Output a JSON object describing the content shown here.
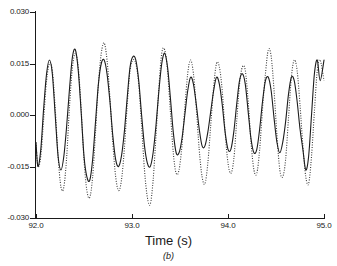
{
  "chart_data": {
    "type": "line",
    "title": "",
    "subtitle": "",
    "caption": "(b)",
    "xlabel": "Time (s)",
    "ylabel": "",
    "xlim": [
      92.0,
      95.0
    ],
    "ylim": [
      -0.03,
      0.03
    ],
    "xticks": [
      "92.0",
      "93.0",
      "94.0",
      "95.0"
    ],
    "xtick_values": [
      92.0,
      93.0,
      94.0,
      95.0
    ],
    "yticks": [
      "0.030",
      "0.015",
      "0.000",
      "-0.015",
      "-0.030"
    ],
    "ytick_values": [
      0.03,
      0.015,
      0.0,
      -0.015,
      -0.03
    ],
    "grid": false,
    "legend": null,
    "legend_position": "none",
    "frame": "left-bottom",
    "colors": {
      "solid_trace": "#1c1c1c",
      "dotted_trace": "#3a3a3a",
      "axis": "#1a1a1a",
      "background": "#ffffff"
    },
    "series": [
      {
        "name": "solid",
        "style": "solid",
        "x": [
          92.0,
          92.02,
          92.05,
          92.08,
          92.11,
          92.14,
          92.17,
          92.2,
          92.23,
          92.26,
          92.29,
          92.32,
          92.35,
          92.38,
          92.41,
          92.44,
          92.47,
          92.5,
          92.53,
          92.56,
          92.59,
          92.62,
          92.65,
          92.68,
          92.71,
          92.74,
          92.77,
          92.8,
          92.83,
          92.86,
          92.89,
          92.92,
          92.95,
          92.98,
          93.01,
          93.04,
          93.07,
          93.1,
          93.13,
          93.16,
          93.19,
          93.22,
          93.25,
          93.28,
          93.31,
          93.34,
          93.37,
          93.4,
          93.43,
          93.46,
          93.49,
          93.52,
          93.55,
          93.58,
          93.61,
          93.64,
          93.67,
          93.7,
          93.73,
          93.76,
          93.79,
          93.82,
          93.85,
          93.88,
          93.91,
          93.94,
          93.97,
          94.0,
          94.03,
          94.06,
          94.09,
          94.12,
          94.15,
          94.18,
          94.21,
          94.24,
          94.27,
          94.3,
          94.33,
          94.36,
          94.39,
          94.42,
          94.45,
          94.48,
          94.51,
          94.54,
          94.57,
          94.6,
          94.63,
          94.66,
          94.69,
          94.72,
          94.75,
          94.78,
          94.81,
          94.84,
          94.87,
          94.9,
          94.93,
          94.96,
          95.0
        ],
        "y": [
          -0.008,
          -0.015,
          -0.01,
          0.002,
          0.012,
          0.016,
          0.012,
          0.0,
          -0.012,
          -0.016,
          -0.012,
          -0.003,
          0.008,
          0.017,
          0.019,
          0.013,
          0.001,
          -0.012,
          -0.018,
          -0.019,
          -0.013,
          -0.002,
          0.009,
          0.015,
          0.016,
          0.012,
          0.004,
          -0.006,
          -0.013,
          -0.015,
          -0.012,
          -0.005,
          0.005,
          0.014,
          0.017,
          0.016,
          0.01,
          0.0,
          -0.009,
          -0.014,
          -0.015,
          -0.011,
          -0.003,
          0.007,
          0.015,
          0.018,
          0.014,
          0.005,
          -0.005,
          -0.011,
          -0.011,
          -0.007,
          0.0,
          0.007,
          0.011,
          0.009,
          0.003,
          -0.004,
          -0.009,
          -0.009,
          -0.005,
          0.001,
          0.007,
          0.011,
          0.009,
          0.003,
          -0.005,
          -0.01,
          -0.01,
          -0.005,
          0.003,
          0.01,
          0.012,
          0.009,
          0.001,
          -0.007,
          -0.011,
          -0.01,
          -0.004,
          0.004,
          0.01,
          0.011,
          0.007,
          -0.001,
          -0.008,
          -0.011,
          -0.008,
          -0.002,
          0.006,
          0.011,
          0.01,
          0.004,
          -0.004,
          -0.01,
          -0.016,
          -0.012,
          0.0,
          0.012,
          0.016,
          0.01,
          0.016
        ]
      },
      {
        "name": "dotted",
        "style": "dotted",
        "x": [
          92.0,
          92.02,
          92.05,
          92.08,
          92.11,
          92.14,
          92.17,
          92.2,
          92.23,
          92.26,
          92.29,
          92.32,
          92.35,
          92.38,
          92.41,
          92.44,
          92.47,
          92.5,
          92.53,
          92.56,
          92.59,
          92.62,
          92.65,
          92.68,
          92.71,
          92.74,
          92.77,
          92.8,
          92.83,
          92.86,
          92.89,
          92.92,
          92.95,
          92.98,
          93.01,
          93.04,
          93.07,
          93.1,
          93.13,
          93.16,
          93.19,
          93.22,
          93.25,
          93.28,
          93.31,
          93.34,
          93.37,
          93.4,
          93.43,
          93.46,
          93.49,
          93.52,
          93.55,
          93.58,
          93.61,
          93.64,
          93.67,
          93.7,
          93.73,
          93.76,
          93.79,
          93.82,
          93.85,
          93.88,
          93.91,
          93.94,
          93.97,
          94.0,
          94.03,
          94.06,
          94.09,
          94.12,
          94.15,
          94.18,
          94.21,
          94.24,
          94.27,
          94.3,
          94.33,
          94.36,
          94.39,
          94.42,
          94.45,
          94.48,
          94.51,
          94.54,
          94.57,
          94.6,
          94.63,
          94.66,
          94.69,
          94.72,
          94.75,
          94.78,
          94.81,
          94.84,
          94.87,
          94.9,
          94.93,
          94.96,
          95.0
        ],
        "y": [
          -0.008,
          -0.015,
          -0.012,
          -0.001,
          0.01,
          0.015,
          0.013,
          0.002,
          -0.012,
          -0.021,
          -0.021,
          -0.012,
          0.003,
          0.014,
          0.018,
          0.014,
          0.002,
          -0.013,
          -0.022,
          -0.024,
          -0.018,
          -0.005,
          0.009,
          0.018,
          0.021,
          0.016,
          0.005,
          -0.008,
          -0.018,
          -0.022,
          -0.019,
          -0.01,
          0.003,
          0.013,
          0.016,
          0.015,
          0.009,
          -0.003,
          -0.016,
          -0.024,
          -0.026,
          -0.019,
          -0.006,
          0.008,
          0.018,
          0.019,
          0.013,
          0.001,
          -0.011,
          -0.017,
          -0.016,
          -0.009,
          0.002,
          0.012,
          0.016,
          0.012,
          0.002,
          -0.01,
          -0.018,
          -0.02,
          -0.014,
          -0.003,
          0.008,
          0.015,
          0.014,
          0.007,
          -0.005,
          -0.014,
          -0.017,
          -0.013,
          -0.002,
          0.009,
          0.014,
          0.013,
          0.004,
          -0.008,
          -0.016,
          -0.017,
          -0.01,
          0.002,
          0.012,
          0.019,
          0.017,
          0.007,
          -0.006,
          -0.016,
          -0.018,
          -0.013,
          -0.001,
          0.011,
          0.016,
          0.013,
          0.003,
          -0.009,
          -0.018,
          -0.02,
          -0.012,
          0.001,
          0.013,
          0.016,
          0.01
        ]
      }
    ]
  }
}
